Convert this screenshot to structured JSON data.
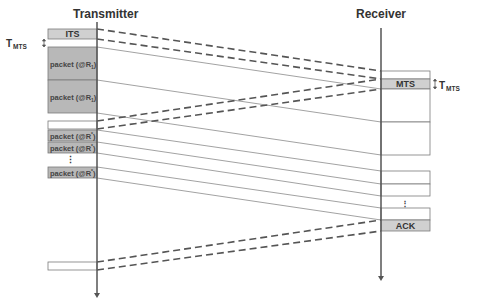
{
  "headers": {
    "transmitter": "Transmitter",
    "receiver": "Receiver"
  },
  "transmitter_boxes": [
    {
      "label": "ITS",
      "y": 29,
      "h": 10,
      "fill": "#d0d0d0"
    },
    {
      "label": "packet (@R",
      "sub": "1",
      "tail": ")",
      "y": 47,
      "h": 33,
      "fill": "#b8b8b8"
    },
    {
      "label": "packet (@R",
      "sub": "1",
      "tail": ")",
      "y": 80,
      "h": 33,
      "fill": "#b8b8b8"
    },
    {
      "label": "",
      "y": 121,
      "h": 8,
      "fill": "#ffffff"
    },
    {
      "label": "packet (@R",
      "sup": "*",
      "tail": ")",
      "y": 130,
      "h": 11,
      "fill": "#b8b8b8"
    },
    {
      "label": "packet (@R",
      "sup": "*",
      "tail": ")",
      "y": 142,
      "h": 11,
      "fill": "#b8b8b8"
    },
    {
      "label": "packet (@R",
      "sup": "*",
      "tail": ")",
      "y": 167,
      "h": 11,
      "fill": "#b8b8b8"
    },
    {
      "label": "",
      "y": 262,
      "h": 8,
      "fill": "#ffffff"
    }
  ],
  "receiver_boxes": [
    {
      "label": "",
      "y": 71,
      "h": 8,
      "fill": "#ffffff"
    },
    {
      "label": "MTS",
      "y": 79,
      "h": 10,
      "fill": "#d0d0d0"
    },
    {
      "label": "",
      "y": 89,
      "h": 33,
      "fill": "#ffffff"
    },
    {
      "label": "",
      "y": 122,
      "h": 33,
      "fill": "#ffffff"
    },
    {
      "label": "",
      "y": 171,
      "h": 13,
      "fill": "#ffffff"
    },
    {
      "label": "",
      "y": 184,
      "h": 12,
      "fill": "#ffffff"
    },
    {
      "label": "",
      "y": 208,
      "h": 12,
      "fill": "#ffffff"
    },
    {
      "label": "ACK",
      "y": 220,
      "h": 11,
      "fill": "#d0d0d0"
    }
  ],
  "annotations": {
    "t_mts_left": {
      "main": "T",
      "sub": "MTS"
    },
    "t_mts_right": {
      "main": "T",
      "sub": "MTS"
    },
    "ellipsis": "⋮"
  },
  "signals": {
    "dashed": [
      {
        "x1": 97,
        "y1": 29,
        "x2": 381,
        "y2": 71
      },
      {
        "x1": 97,
        "y1": 39,
        "x2": 381,
        "y2": 79
      },
      {
        "x1": 97,
        "y1": 121,
        "x2": 381,
        "y2": 79
      },
      {
        "x1": 97,
        "y1": 129,
        "x2": 381,
        "y2": 89
      },
      {
        "x1": 97,
        "y1": 262,
        "x2": 381,
        "y2": 220
      },
      {
        "x1": 97,
        "y1": 270,
        "x2": 381,
        "y2": 231
      }
    ],
    "solid": [
      {
        "x1": 97,
        "y1": 47,
        "x2": 381,
        "y2": 89
      },
      {
        "x1": 97,
        "y1": 80,
        "x2": 381,
        "y2": 122
      },
      {
        "x1": 97,
        "y1": 113,
        "x2": 381,
        "y2": 155
      },
      {
        "x1": 97,
        "y1": 130,
        "x2": 381,
        "y2": 171
      },
      {
        "x1": 97,
        "y1": 142,
        "x2": 381,
        "y2": 184
      },
      {
        "x1": 97,
        "y1": 153,
        "x2": 381,
        "y2": 196
      },
      {
        "x1": 97,
        "y1": 167,
        "x2": 381,
        "y2": 208
      },
      {
        "x1": 97,
        "y1": 178,
        "x2": 381,
        "y2": 220
      }
    ]
  },
  "colors": {
    "line": "#6e6e6e",
    "timeline": "#555555",
    "box_stroke": "#7a7a7a"
  }
}
